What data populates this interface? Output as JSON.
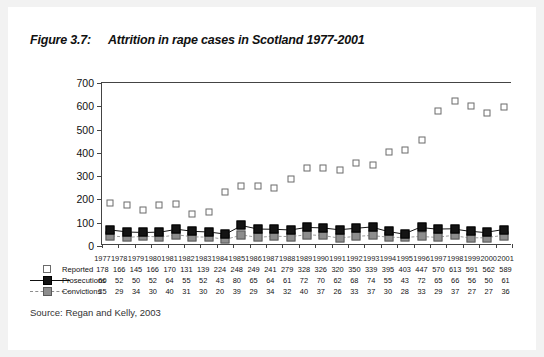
{
  "figure": {
    "number": "Figure 3.7:",
    "title": "Attrition in rape cases in Scotland 1977-2001",
    "source": "Source: Regan and Kelly, 2003"
  },
  "chart_data": {
    "type": "line",
    "title": "Attrition in rape cases in Scotland 1977-2001",
    "xlabel": "",
    "ylabel": "",
    "ylim": [
      0,
      700
    ],
    "yticks": [
      0,
      100,
      200,
      300,
      400,
      500,
      600,
      700
    ],
    "grid": false,
    "legend_position": "bottom-left",
    "categories": [
      "1977",
      "1978",
      "1979",
      "1980",
      "1981",
      "1982",
      "1983",
      "1984",
      "1985",
      "1986",
      "1987",
      "1988",
      "1989",
      "1990",
      "1991",
      "1992",
      "1993",
      "1994",
      "1995",
      "1996",
      "1997",
      "1998",
      "1999",
      "2000",
      "2001"
    ],
    "series": [
      {
        "name": "Reported",
        "marker": "open-square",
        "color": "#ffffff",
        "line": "none",
        "values": [
          178,
          166,
          145,
          166,
          170,
          131,
          139,
          224,
          248,
          249,
          241,
          279,
          328,
          326,
          320,
          350,
          339,
          395,
          403,
          447,
          570,
          613,
          591,
          562,
          589
        ]
      },
      {
        "name": "Prosecutions",
        "marker": "filled-square",
        "color": "#141414",
        "line": "solid",
        "values": [
          60,
          52,
          50,
          52,
          64,
          55,
          52,
          43,
          80,
          65,
          64,
          61,
          72,
          70,
          62,
          68,
          74,
          55,
          43,
          72,
          65,
          66,
          56,
          50,
          61
        ]
      },
      {
        "name": "Convictions",
        "marker": "gray-square",
        "color": "#8d8d8d",
        "line": "dashed",
        "values": [
          35,
          29,
          34,
          30,
          40,
          31,
          30,
          20,
          39,
          29,
          34,
          32,
          40,
          37,
          26,
          33,
          37,
          30,
          28,
          33,
          29,
          37,
          27,
          27,
          36
        ]
      }
    ]
  }
}
